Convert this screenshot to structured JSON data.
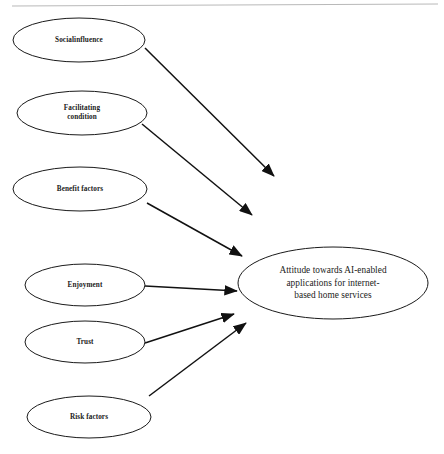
{
  "diagram": {
    "background_color": "#ffffff",
    "stroke_color": "#1a1a1a",
    "text_color": "#1b1b1b",
    "top_rule_color": "#b9b9b9",
    "predictors": [
      {
        "id": "social-influence",
        "label": "Socialinfluence",
        "lines": [
          "Socialinfluence"
        ],
        "cx": 79,
        "cy": 40,
        "rx": 66,
        "ry": 22
      },
      {
        "id": "facilitating-condition",
        "label": "Facilitating condition",
        "lines": [
          "Facilitating",
          "condition"
        ],
        "cx": 82,
        "cy": 113,
        "rx": 65,
        "ry": 22
      },
      {
        "id": "benefit-factors",
        "label": "Benefit factors",
        "lines": [
          "Benefit factors"
        ],
        "cx": 80,
        "cy": 189,
        "rx": 67,
        "ry": 22
      },
      {
        "id": "enjoyment",
        "label": "Enjoyment",
        "lines": [
          "Enjoyment"
        ],
        "cx": 85,
        "cy": 285,
        "rx": 60,
        "ry": 21
      },
      {
        "id": "trust",
        "label": "Trust",
        "lines": [
          "Trust"
        ],
        "cx": 85,
        "cy": 342,
        "rx": 60,
        "ry": 21
      },
      {
        "id": "risk-factors",
        "label": "Risk factors",
        "lines": [
          "Risk factors"
        ],
        "cx": 89,
        "cy": 417,
        "rx": 62,
        "ry": 21
      }
    ],
    "outcome": {
      "id": "attitude-outcome",
      "label": "Attitude towards AI-enabled applications for internet-based home services",
      "lines": [
        "Attitude towards AI-enabled",
        "applications for internet-",
        "based home services"
      ],
      "cx": 333,
      "cy": 283,
      "rx": 95,
      "ry": 36
    },
    "arrows": [
      {
        "id": "arrow-social-influence",
        "from": "social-influence",
        "to": "attitude-outcome",
        "x1": 145,
        "y1": 48,
        "x2": 274,
        "y2": 176
      },
      {
        "id": "arrow-facilitating-condition",
        "from": "facilitating-condition",
        "to": "attitude-outcome",
        "x1": 142,
        "y1": 124,
        "x2": 252,
        "y2": 215
      },
      {
        "id": "arrow-benefit-factors",
        "from": "benefit-factors",
        "to": "attitude-outcome",
        "x1": 147,
        "y1": 203,
        "x2": 242,
        "y2": 256
      },
      {
        "id": "arrow-enjoyment",
        "from": "enjoyment",
        "to": "attitude-outcome",
        "x1": 145,
        "y1": 286,
        "x2": 237,
        "y2": 291
      },
      {
        "id": "arrow-trust",
        "from": "trust",
        "to": "attitude-outcome",
        "x1": 145,
        "y1": 343,
        "x2": 234,
        "y2": 314
      },
      {
        "id": "arrow-risk-factors",
        "from": "risk-factors",
        "to": "attitude-outcome",
        "x1": 149,
        "y1": 396,
        "x2": 246,
        "y2": 323
      }
    ],
    "top_rule": {
      "x1": 12,
      "y1": 6,
      "x2": 438,
      "y2": 4
    }
  }
}
